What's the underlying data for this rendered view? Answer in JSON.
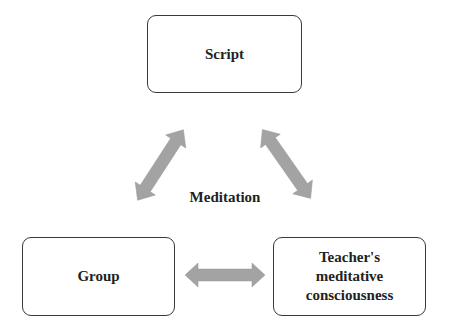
{
  "diagram": {
    "type": "cycle",
    "center_label": "Meditation",
    "nodes": [
      {
        "id": "script",
        "label": "Script"
      },
      {
        "id": "group",
        "label": "Group"
      },
      {
        "id": "teacher",
        "label": "Teacher's\nmeditative\nconsciousness"
      }
    ],
    "edges": [
      {
        "from": "script",
        "to": "group",
        "direction": "bidirectional"
      },
      {
        "from": "script",
        "to": "teacher",
        "direction": "bidirectional"
      },
      {
        "from": "group",
        "to": "teacher",
        "direction": "bidirectional"
      }
    ],
    "colors": {
      "arrow": "#a3a3a3",
      "box_border": "#3a3a3a",
      "text": "#222222",
      "background": "#ffffff"
    }
  }
}
